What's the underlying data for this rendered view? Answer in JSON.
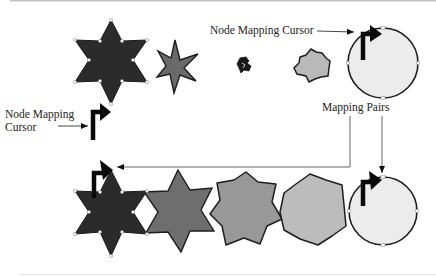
{
  "diagram": {
    "labels": {
      "top_cursor": "Node Mapping Cursor",
      "left_cursor_line1": "Node Mapping",
      "left_cursor_line2": "Cursor",
      "mapping_pairs": "Mapping Pairs"
    },
    "rows": [
      {
        "name": "top-row",
        "shapes": [
          {
            "kind": "six-point-star",
            "fill": "#2b2b2b",
            "selected": true
          },
          {
            "kind": "slim-six-point-star",
            "fill": "#6a6a6a"
          },
          {
            "kind": "tiny-distorted-shape",
            "fill": "#1a1a1a"
          },
          {
            "kind": "irregular-blob",
            "fill": "#b9b9b9"
          },
          {
            "kind": "circle",
            "fill": "#ececec",
            "selected": true
          }
        ]
      },
      {
        "name": "bottom-row",
        "shapes": [
          {
            "kind": "six-point-star",
            "fill": "#2b2b2b",
            "selected": true
          },
          {
            "kind": "six-point-star",
            "fill": "#6e6e6e"
          },
          {
            "kind": "rounded-six-point-star",
            "fill": "#989898"
          },
          {
            "kind": "rounded-polygon",
            "fill": "#bcbcbc"
          },
          {
            "kind": "circle",
            "fill": "#ececec",
            "selected": true
          }
        ]
      }
    ],
    "colors": {
      "stroke": "#1e1e1e",
      "dark_star": "#2b2b2b",
      "circle_fill": "#ececec",
      "line": "#555555"
    }
  }
}
